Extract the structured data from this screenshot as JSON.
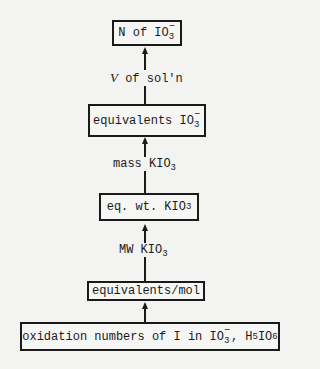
{
  "diagram": {
    "nodes": [
      {
        "id": "n1",
        "base": "N of IO",
        "sup": "−",
        "sub": "3"
      },
      {
        "id": "n2",
        "base": "equivalents IO",
        "sup": "−",
        "sub": "3"
      },
      {
        "id": "n3",
        "base": "eq. wt. KIO",
        "sub": "3"
      },
      {
        "id": "n4",
        "text": "equivalents/mol"
      },
      {
        "id": "n5",
        "part1": "oxidation numbers of I in IO",
        "sup": "−",
        "sub1": "3",
        "part2": ", H",
        "sub2": "5",
        "part3": "IO",
        "sub3": "6"
      }
    ],
    "edges": [
      {
        "from": "n2",
        "to": "n1",
        "label_italic": "V",
        "label_rest": " of sol'n"
      },
      {
        "from": "n3",
        "to": "n2",
        "label_base": "mass KIO",
        "label_sub": "3"
      },
      {
        "from": "n4",
        "to": "n3",
        "label_base": "MW KIO",
        "label_sub": "3"
      },
      {
        "from": "n5",
        "to": "n4"
      }
    ]
  }
}
